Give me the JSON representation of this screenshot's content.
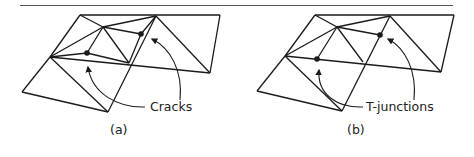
{
  "figure": {
    "panels": [
      {
        "id": "a",
        "caption": "(a)",
        "annotation": "Cracks",
        "description": "Adjacent mesh triangles with vertices lying on edges of neighbors, producing cracks"
      },
      {
        "id": "b",
        "caption": "(b)",
        "annotation": "T-junctions",
        "description": "Same mesh with the vertices lying exactly on neighbor edges, forming T-junctions"
      }
    ],
    "colors": {
      "stroke": "#1a1a1a",
      "rule": "#555555",
      "background": "#ffffff"
    }
  }
}
